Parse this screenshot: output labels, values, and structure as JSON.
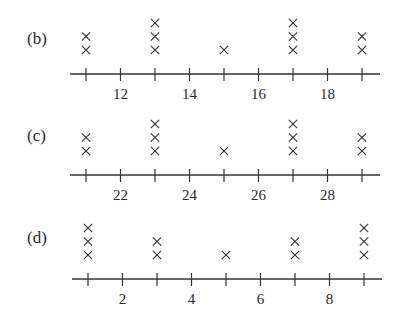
{
  "chart_data": [
    {
      "type": "dot_plot",
      "panel_label": "(b)",
      "x_ticks": [
        11,
        12,
        13,
        14,
        15,
        16,
        17,
        18,
        19
      ],
      "x_tick_labels": [
        "12",
        "14",
        "16",
        "18"
      ],
      "labeled_tick_values": [
        12,
        14,
        16,
        18
      ],
      "points": [
        {
          "x": 11,
          "count": 2
        },
        {
          "x": 13,
          "count": 3
        },
        {
          "x": 15,
          "count": 1
        },
        {
          "x": 17,
          "count": 3
        },
        {
          "x": 19,
          "count": 2
        }
      ],
      "marker": "x",
      "xlim": [
        11,
        19
      ],
      "grid": false
    },
    {
      "type": "dot_plot",
      "panel_label": "(c)",
      "x_ticks": [
        21,
        22,
        23,
        24,
        25,
        26,
        27,
        28,
        29
      ],
      "x_tick_labels": [
        "22",
        "24",
        "26",
        "28"
      ],
      "labeled_tick_values": [
        22,
        24,
        26,
        28
      ],
      "points": [
        {
          "x": 21,
          "count": 2
        },
        {
          "x": 23,
          "count": 3
        },
        {
          "x": 25,
          "count": 1
        },
        {
          "x": 27,
          "count": 3
        },
        {
          "x": 29,
          "count": 2
        }
      ],
      "marker": "x",
      "xlim": [
        21,
        29
      ],
      "grid": false
    },
    {
      "type": "dot_plot",
      "panel_label": "(d)",
      "x_ticks": [
        1,
        2,
        3,
        4,
        5,
        6,
        7,
        8,
        9
      ],
      "x_tick_labels": [
        "2",
        "4",
        "6",
        "8"
      ],
      "labeled_tick_values": [
        2,
        4,
        6,
        8
      ],
      "points": [
        {
          "x": 1,
          "count": 3
        },
        {
          "x": 3,
          "count": 2
        },
        {
          "x": 5,
          "count": 1
        },
        {
          "x": 7,
          "count": 2
        },
        {
          "x": 9,
          "count": 3
        }
      ],
      "marker": "x",
      "xlim": [
        1,
        9
      ],
      "grid": false
    }
  ],
  "layout": {
    "panels": [
      {
        "axis_y": 74,
        "label_y": 44,
        "x_start": 86,
        "spacing": 34.5,
        "line_x1": 70,
        "line_x2": 380
      },
      {
        "axis_y": 175,
        "label_y": 141,
        "x_start": 86,
        "spacing": 34.5,
        "line_x1": 70,
        "line_x2": 380
      },
      {
        "axis_y": 279,
        "label_y": 243,
        "x_start": 88,
        "spacing": 34.5,
        "line_x1": 72,
        "line_x2": 382
      }
    ]
  }
}
